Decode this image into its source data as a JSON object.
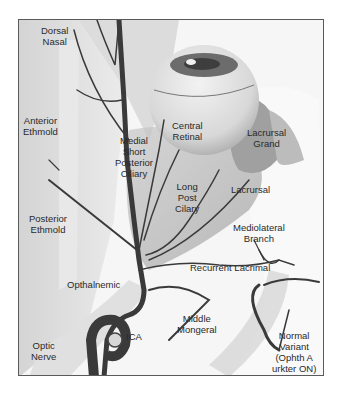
{
  "figure": {
    "type": "anatomical-illustration",
    "colors": {
      "vessel": "#3a3a3a",
      "background": "#f4f4f4",
      "frame": "#5a5a5a",
      "text": "#2a2a2a"
    }
  },
  "labels": {
    "dorsal_nasal": [
      "Dorsal",
      "Nasal"
    ],
    "anterior_ethmoid": [
      "Anterior",
      "Ethmold"
    ],
    "posterior_ethmoid": [
      "Posterior",
      "Ethmold"
    ],
    "medial_short_posterior_ciliary": [
      "Medial",
      "Short",
      "Posterior",
      "Ciliary"
    ],
    "central_retinal": [
      "Central",
      "Retinal"
    ],
    "lacrimal_gland": [
      "Lacrursal",
      "Grand"
    ],
    "lacrimal": "Lacrursal",
    "long_post_ciliary": [
      "Long",
      "Post",
      "Cilary"
    ],
    "mediolateral_branch": [
      "Mediolateral",
      "Branch"
    ],
    "recurrent_lacrimal": "Recurrent Lacrimal",
    "ophthalmic": "Opthalnemic",
    "middle_meningeal": [
      "Middle",
      "Mongeral"
    ],
    "ica": "ICA",
    "optic_nerve": [
      "Optic",
      "Nerve"
    ],
    "normal_variant": [
      "Normal",
      "Variant",
      "(Ophth A",
      "urkter ON)"
    ]
  }
}
